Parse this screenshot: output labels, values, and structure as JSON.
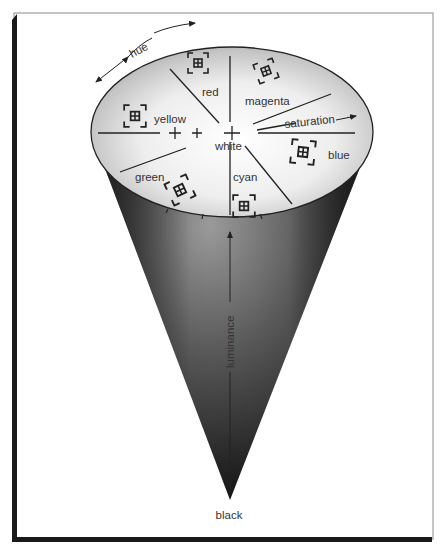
{
  "diagram": {
    "type": "cone",
    "labels": {
      "hue": "hue",
      "saturation": "saturation",
      "luminance": "luminance",
      "white": "white",
      "black": "black"
    },
    "hues": [
      {
        "name": "red"
      },
      {
        "name": "magenta"
      },
      {
        "name": "blue"
      },
      {
        "name": "cyan"
      },
      {
        "name": "green"
      },
      {
        "name": "yellow"
      }
    ],
    "icon": "viewfinder-window-icon",
    "colors": {
      "frame_dark": "#1a1a1a",
      "frame_light": "#8a8a8a",
      "cone_dark": "#1c1c1c",
      "cone_light": "#8d8d8d",
      "top_center": "#ffffff",
      "top_edge": "#9a9a9a",
      "ink": "#222222"
    }
  }
}
